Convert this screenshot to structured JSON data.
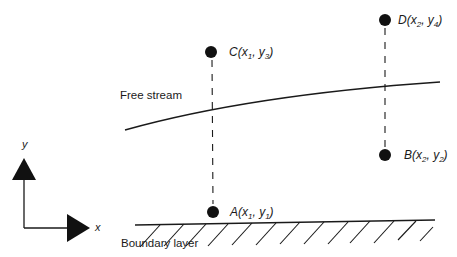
{
  "diagram": {
    "regions": {
      "free_stream": "Free stream",
      "boundary_layer": "Boundary layer"
    },
    "axes": {
      "x_label": "x",
      "y_label": "y"
    },
    "points": [
      {
        "id": "C",
        "letter": "C",
        "xvar": "x",
        "xsub": "1",
        "yvar": "y",
        "ysub": "3"
      },
      {
        "id": "D",
        "letter": "D",
        "xvar": "x",
        "xsub": "2",
        "yvar": "y",
        "ysub": "4"
      },
      {
        "id": "B",
        "letter": "B",
        "xvar": "x",
        "xsub": "2",
        "yvar": "y",
        "ysub": "2"
      },
      {
        "id": "A",
        "letter": "A",
        "xvar": "x",
        "xsub": "1",
        "yvar": "y",
        "ysub": "1"
      }
    ],
    "colors": {
      "ink": "#1a1a1a",
      "background": "#ffffff"
    }
  }
}
